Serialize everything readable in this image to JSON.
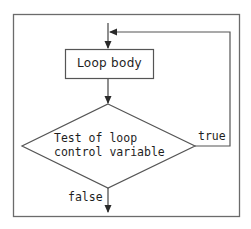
{
  "diagram": {
    "type": "flowchart",
    "title": "",
    "colors": {
      "stroke": "#555555",
      "text": "#1e1e1e",
      "background": "#ffffff"
    },
    "nodes": {
      "loop_body": {
        "shape": "rectangle",
        "label": "Loop body"
      },
      "test": {
        "shape": "diamond",
        "label_line1": "Test of loop",
        "label_line2": "control variable"
      }
    },
    "edges": {
      "entry": {
        "from": "start",
        "to": "loop_body",
        "label": ""
      },
      "body_to_test": {
        "from": "loop_body",
        "to": "test",
        "label": ""
      },
      "true_branch": {
        "from": "test",
        "to": "loop_body",
        "label": "true"
      },
      "false_branch": {
        "from": "test",
        "to": "exit",
        "label": "false"
      }
    }
  }
}
